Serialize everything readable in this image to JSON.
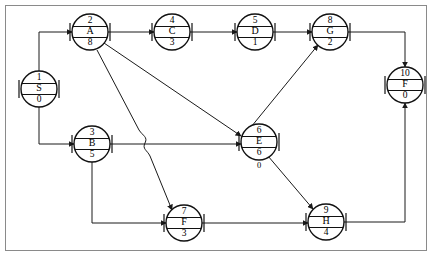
{
  "diagram": {
    "type": "directed-graph",
    "frame": {
      "visible": true,
      "color": "#8a8a8a"
    },
    "edge_color": "#1a1a1a",
    "node_color": "#111111",
    "nodes": [
      {
        "id": "S",
        "top": "1",
        "letter": "S",
        "bottom": "0",
        "extra": "",
        "cx": 39,
        "cy": 89
      },
      {
        "id": "A",
        "top": "2",
        "letter": "A",
        "bottom": "8",
        "extra": "",
        "cx": 90,
        "cy": 32
      },
      {
        "id": "C",
        "top": "4",
        "letter": "C",
        "bottom": "3",
        "extra": "",
        "cx": 172,
        "cy": 32
      },
      {
        "id": "D",
        "top": "5",
        "letter": "D",
        "bottom": "1",
        "extra": "",
        "cx": 255,
        "cy": 32
      },
      {
        "id": "G",
        "top": "8",
        "letter": "G",
        "bottom": "2",
        "extra": "",
        "cx": 330,
        "cy": 32
      },
      {
        "id": "F10",
        "top": "10",
        "letter": "F",
        "bottom": "0",
        "extra": "",
        "cx": 405,
        "cy": 85
      },
      {
        "id": "B",
        "top": "3",
        "letter": "B",
        "bottom": "5",
        "extra": "",
        "cx": 92,
        "cy": 144
      },
      {
        "id": "E",
        "top": "6",
        "letter": "E",
        "bottom": "6",
        "extra": "0",
        "cx": 259,
        "cy": 142
      },
      {
        "id": "F7",
        "top": "7",
        "letter": "F",
        "bottom": "3",
        "extra": "",
        "cx": 184,
        "cy": 223
      },
      {
        "id": "H",
        "top": "9",
        "letter": "H",
        "bottom": "4",
        "extra": "",
        "cx": 326,
        "cy": 222
      }
    ],
    "edges": [
      {
        "from": "S",
        "to": "A",
        "label": ""
      },
      {
        "from": "S",
        "to": "B",
        "label": ""
      },
      {
        "from": "A",
        "to": "C",
        "label": ""
      },
      {
        "from": "C",
        "to": "D",
        "label": ""
      },
      {
        "from": "D",
        "to": "G",
        "label": ""
      },
      {
        "from": "A",
        "to": "E",
        "label": ""
      },
      {
        "from": "A",
        "to": "F7",
        "label": ""
      },
      {
        "from": "B",
        "to": "E",
        "label": ""
      },
      {
        "from": "B",
        "to": "F7",
        "label": ""
      },
      {
        "from": "E",
        "to": "G",
        "label": ""
      },
      {
        "from": "E",
        "to": "H",
        "label": ""
      },
      {
        "from": "F7",
        "to": "H",
        "label": ""
      },
      {
        "from": "G",
        "to": "F10",
        "label": ""
      },
      {
        "from": "H",
        "to": "F10",
        "label": ""
      }
    ]
  }
}
